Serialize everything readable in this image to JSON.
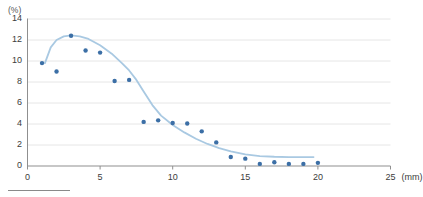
{
  "chart_data": {
    "type": "scatter",
    "title": "",
    "subtitle": "",
    "xlabel": "(mm)",
    "ylabel": "(%)",
    "xlim": [
      0,
      25
    ],
    "ylim": [
      0,
      14
    ],
    "x_ticks": [
      0,
      5,
      10,
      15,
      20,
      25
    ],
    "x_tick_labels": [
      "0",
      "5",
      "10",
      "15",
      "20",
      "25"
    ],
    "y_ticks": [
      0,
      2,
      4,
      6,
      8,
      10,
      12,
      14
    ],
    "y_tick_labels": [
      "0",
      "2",
      "4",
      "6",
      "8",
      "10",
      "12",
      "14"
    ],
    "grid": true,
    "grid_axis": "y",
    "legend": false,
    "legend_position": "none",
    "annotations": [],
    "series": [
      {
        "name": "measured",
        "kind": "markers",
        "color": "#3c6fa6",
        "x": [
          1,
          2,
          3,
          4,
          5,
          6,
          7,
          8,
          9,
          10,
          11,
          12,
          13,
          14,
          15,
          16,
          17,
          18,
          19,
          20
        ],
        "values": [
          9.8,
          9.0,
          12.4,
          11.0,
          10.8,
          8.1,
          8.2,
          4.2,
          4.35,
          4.1,
          4.05,
          3.3,
          2.25,
          0.85,
          0.7,
          0.2,
          0.35,
          0.2,
          0.2,
          0.3
        ]
      },
      {
        "name": "fitted-curve",
        "kind": "line",
        "color": "#a9c9e2",
        "x": [
          1.2,
          1.6,
          2.0,
          2.5,
          3.0,
          3.6,
          4.2,
          5.0,
          5.8,
          6.5,
          7.0,
          7.5,
          8.0,
          8.6,
          9.2,
          10.0,
          10.8,
          11.6,
          12.4,
          13.2,
          14.0,
          15.0,
          16.0,
          17.0,
          18.0,
          19.0,
          19.7
        ],
        "values": [
          9.8,
          11.3,
          12.0,
          12.35,
          12.45,
          12.35,
          12.1,
          11.5,
          10.7,
          9.8,
          9.1,
          8.2,
          7.1,
          5.8,
          4.8,
          3.9,
          3.2,
          2.6,
          2.1,
          1.7,
          1.4,
          1.1,
          0.95,
          0.88,
          0.85,
          0.85,
          0.85
        ]
      }
    ]
  },
  "axes": {
    "y_unit_label": "(%)",
    "x_unit_label": "(mm)"
  },
  "marker": {
    "radius_px": 2.2,
    "color": "#3c6fa6"
  },
  "curve": {
    "color": "#a9c9e2",
    "width_px": 1.8
  },
  "grid_color": "#e6e6e6",
  "axis_color": "#8f8f8f",
  "footer": {
    "rule_present": true
  }
}
